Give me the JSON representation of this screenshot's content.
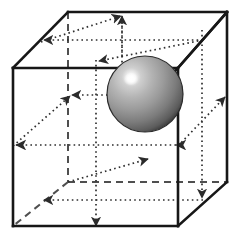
{
  "figure": {
    "title": "Cube with inscribed shaded sphere and directional arrows",
    "type": "geometric-diagram",
    "canvas": {
      "width": 239,
      "height": 242,
      "background": "#ffffff"
    },
    "colors": {
      "edge_solid": "#1a1a1a",
      "edge_hidden_dashed": "#555555",
      "arrow_dotted": "#333333",
      "sphere_highlight": "#ffffff",
      "sphere_light": "#d8d8d8",
      "sphere_mid": "#9a9a9a",
      "sphere_dark": "#4a4a4a",
      "sphere_edge": "#2b2b2b"
    },
    "cube": {
      "label": "cube-wireframe",
      "vertices": {
        "front_top_left": [
          13,
          68
        ],
        "front_top_right": [
          178,
          68
        ],
        "front_bottom_left": [
          13,
          226
        ],
        "front_bottom_right": [
          178,
          226
        ],
        "back_top_left": [
          68,
          12
        ],
        "back_top_right": [
          227,
          12
        ],
        "back_bottom_left": [
          68,
          182
        ],
        "back_bottom_right": [
          227,
          182
        ]
      },
      "solid_edges": [
        "front_top_left-front_top_right",
        "front_top_right-front_bottom_right",
        "front_bottom_right-front_bottom_left",
        "front_bottom_left-front_top_left",
        "front_top_left-back_top_left",
        "back_top_left-back_top_right",
        "back_top_right-front_top_right",
        "back_top_right-back_bottom_right",
        "back_bottom_right-front_bottom_right"
      ],
      "hidden_edges_dashed": [
        "back_top_left-back_bottom_left",
        "back_bottom_left-back_bottom_right",
        "back_bottom_left-front_bottom_left"
      ]
    },
    "sphere": {
      "label": "shaded-sphere",
      "center": [
        145,
        94
      ],
      "radius": 38,
      "highlight_center": [
        131,
        80
      ],
      "highlight_radius": 6
    },
    "arrows": {
      "style": "dotted-with-arrowhead",
      "count": 10,
      "description": "Dotted directional arrows running along face midlines and face diagonals of the cube",
      "items": [
        {
          "name": "arrow-top-face-left",
          "from": [
            202,
            40
          ],
          "to": [
            41,
            40
          ],
          "direction": "left"
        },
        {
          "name": "arrow-top-face-vertical",
          "from": [
            122,
            95
          ],
          "to": [
            122,
            15
          ],
          "direction": "up"
        },
        {
          "name": "arrow-top-face-diagonal",
          "from": [
            202,
            40
          ],
          "to": [
            96,
            62
          ],
          "direction": "down-left"
        },
        {
          "name": "arrow-top-diagonal-up",
          "from": [
            41,
            40
          ],
          "to": [
            122,
            15
          ],
          "direction": "up-right"
        },
        {
          "name": "arrow-mid-left-horizontal",
          "from": [
            122,
            95
          ],
          "to": [
            68,
            95
          ],
          "direction": "left"
        },
        {
          "name": "arrow-mid-left-diagonal",
          "from": [
            13,
            145
          ],
          "to": [
            68,
            95
          ],
          "direction": "up-left"
        },
        {
          "name": "arrow-mid-horizontal-right",
          "from": [
            13,
            145
          ],
          "to": [
            178,
            145
          ],
          "direction": "both"
        },
        {
          "name": "arrow-right-face-diagonal",
          "from": [
            178,
            145
          ],
          "to": [
            227,
            95
          ],
          "direction": "up-right"
        },
        {
          "name": "arrow-bottom-face-left",
          "from": [
            202,
            200
          ],
          "to": [
            41,
            200
          ],
          "direction": "left"
        },
        {
          "name": "arrow-bottom-face-diagonal",
          "from": [
            68,
            182
          ],
          "to": [
            150,
            158
          ],
          "direction": "up-right"
        },
        {
          "name": "arrow-bottom-vertical-down",
          "from": [
            96,
            130
          ],
          "to": [
            96,
            228
          ],
          "direction": "down"
        },
        {
          "name": "arrow-bottom-right-down",
          "from": [
            202,
            160
          ],
          "to": [
            202,
            200
          ],
          "direction": "down"
        }
      ]
    }
  }
}
